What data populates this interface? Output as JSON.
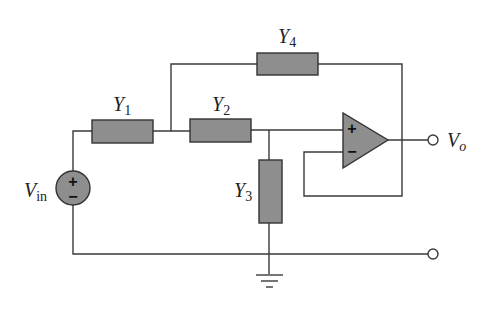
{
  "diagram": {
    "type": "op-amp active filter circuit",
    "components": {
      "Y1": {
        "label": "Y",
        "subscript": "1"
      },
      "Y2": {
        "label": "Y",
        "subscript": "2"
      },
      "Y3": {
        "label": "Y",
        "subscript": "3"
      },
      "Y4": {
        "label": "Y",
        "subscript": "4"
      }
    },
    "source": {
      "label": "V",
      "subscript": "in",
      "plus": "+",
      "minus": "−"
    },
    "output": {
      "label": "V",
      "subscript": "o"
    },
    "opamp": {
      "plus": "+",
      "minus": "−"
    },
    "colors": {
      "component_fill": "#8e8e8e",
      "wire": "#3a3a3a"
    }
  }
}
